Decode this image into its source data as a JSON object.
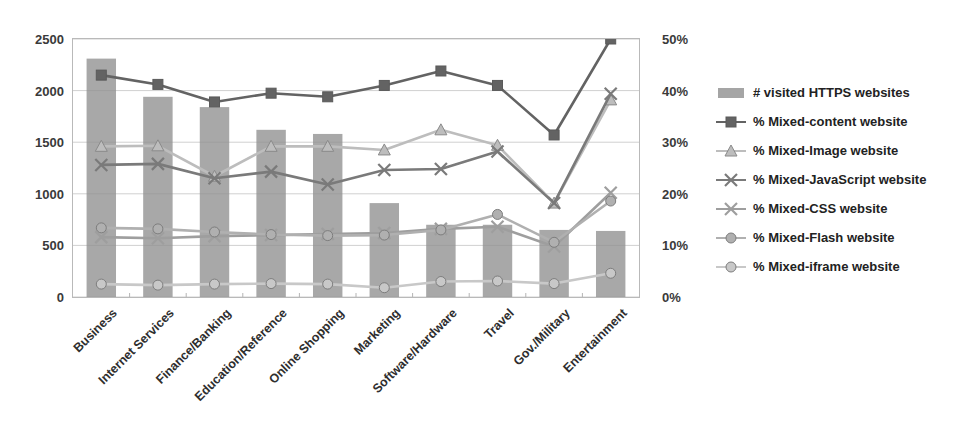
{
  "chart_data": {
    "type": "bar",
    "title": "",
    "subtitle": "",
    "xlabel": "",
    "ylabel": "",
    "ylabel_right": "",
    "grid": true,
    "legend_position": "right",
    "categories": [
      "Business",
      "Internet Services",
      "Finance/Banking",
      "Education/Reference",
      "Online Shopping",
      "Marketing",
      "Software/Hardware",
      "Travel",
      "Gov./Military",
      "Entertainment"
    ],
    "y_axis_left": {
      "ticks": [
        "0",
        "500",
        "1000",
        "1500",
        "2000",
        "2500"
      ],
      "min": 0,
      "max": 2500
    },
    "y_axis_right": {
      "ticks": [
        "0%",
        "10%",
        "20%",
        "30%",
        "40%",
        "50%"
      ],
      "min": 0,
      "max": 50
    },
    "series": [
      {
        "name": "# visited HTTPS websites",
        "kind": "bar",
        "axis": "left",
        "color": "#8f8f8f",
        "marker": "none",
        "values": [
          2310,
          1940,
          1840,
          1620,
          1580,
          910,
          700,
          700,
          650,
          640
        ]
      },
      {
        "name": "% Mixed-content website",
        "kind": "line",
        "axis": "right",
        "color": "#636363",
        "marker": "square",
        "values": [
          43.0,
          41.2,
          37.8,
          39.5,
          38.8,
          41.0,
          43.8,
          41.0,
          31.4,
          50.0
        ]
      },
      {
        "name": "% Mixed-Image website",
        "kind": "line",
        "axis": "right",
        "color": "#bdbdbd",
        "marker": "triangle",
        "values": [
          29.2,
          29.3,
          23.4,
          29.2,
          29.2,
          28.5,
          32.4,
          29.4,
          18.2,
          38.2
        ]
      },
      {
        "name": "% Mixed-JavaScript website",
        "kind": "line",
        "axis": "right",
        "color": "#7a7a7a",
        "marker": "x",
        "values": [
          25.6,
          25.8,
          23.0,
          24.3,
          21.8,
          24.6,
          24.8,
          28.2,
          18.2,
          39.4
        ]
      },
      {
        "name": "% Mixed-CSS website",
        "kind": "line",
        "axis": "right",
        "color": "#9e9e9e",
        "marker": "x",
        "values": [
          11.6,
          11.4,
          11.8,
          12.0,
          12.2,
          12.4,
          13.2,
          13.6,
          9.8,
          20.2
        ]
      },
      {
        "name": "% Mixed-Flash website",
        "kind": "line",
        "axis": "right",
        "color": "#b0b0b0",
        "marker": "circle",
        "values": [
          13.4,
          13.2,
          12.6,
          12.1,
          11.9,
          12.0,
          13.0,
          16.0,
          10.6,
          18.6
        ]
      },
      {
        "name": "% Mixed-iframe website",
        "kind": "line",
        "axis": "right",
        "color": "#c8c8c8",
        "marker": "circle",
        "values": [
          2.5,
          2.3,
          2.5,
          2.6,
          2.5,
          1.8,
          3.0,
          3.1,
          2.6,
          4.6
        ]
      }
    ]
  },
  "legend": {
    "items": [
      {
        "label": "# visited HTTPS websites"
      },
      {
        "label": "% Mixed-content website"
      },
      {
        "label": "% Mixed-Image website"
      },
      {
        "label": "% Mixed-JavaScript website"
      },
      {
        "label": "% Mixed-CSS website"
      },
      {
        "label": "% Mixed-Flash website"
      },
      {
        "label": "% Mixed-iframe website"
      }
    ]
  }
}
